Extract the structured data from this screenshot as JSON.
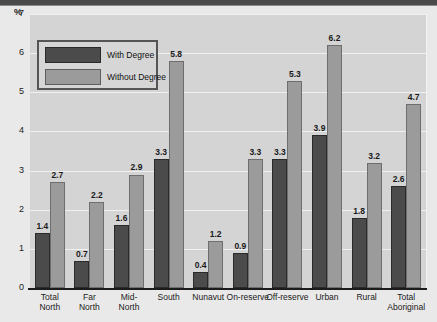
{
  "chart_data": {
    "type": "bar",
    "title": "",
    "subtitle": "",
    "xlabel": "",
    "ylabel": "%",
    "ylim": [
      0,
      7
    ],
    "ytick_labels": [
      "0",
      "1",
      "2",
      "3",
      "4",
      "5",
      "6",
      "7"
    ],
    "yticks": [
      0,
      1,
      2,
      3,
      4,
      5,
      6,
      7
    ],
    "grid": true,
    "legend_position": "top-left",
    "categories": [
      "Total North",
      "Far North",
      "Mid-North",
      "South",
      "Nunavut",
      "On-reserve",
      "Off-reserve",
      "Urban",
      "Rural",
      "Total Aboriginal"
    ],
    "category_lines": [
      [
        "Total",
        "North"
      ],
      [
        "Far",
        "North"
      ],
      [
        "Mid-",
        "North"
      ],
      [
        "South"
      ],
      [
        "Nunavut"
      ],
      [
        "On-reserve"
      ],
      [
        "Off-reserve"
      ],
      [
        "Urban"
      ],
      [
        "Rural"
      ],
      [
        "Total",
        "Aboriginal"
      ]
    ],
    "series": [
      {
        "name": "With Degree",
        "color": "#4b4b4b",
        "values": [
          1.4,
          0.7,
          1.6,
          3.3,
          0.4,
          0.9,
          3.3,
          3.9,
          1.8,
          2.6
        ],
        "labels": [
          "1.4",
          "0.7",
          "1.6",
          "3.3",
          "0.4",
          "0.9",
          "3.3",
          "3.9",
          "1.8",
          "2.6"
        ]
      },
      {
        "name": "Without Degree",
        "color": "#9b9b9b",
        "values": [
          2.7,
          2.2,
          2.9,
          5.8,
          1.2,
          3.3,
          5.3,
          6.2,
          3.2,
          4.7
        ],
        "labels": [
          "2.7",
          "2.2",
          "2.9",
          "5.8",
          "1.2",
          "3.3",
          "5.3",
          "6.2",
          "3.2",
          "4.7"
        ]
      }
    ]
  },
  "legend": {
    "items": [
      {
        "label": "With Degree",
        "swatch": "with"
      },
      {
        "label": "Without Degree",
        "swatch": "without"
      }
    ]
  },
  "axis": {
    "unit_label": "%"
  },
  "colors": {
    "with_degree": "#4b4b4b",
    "without_degree": "#9b9b9b",
    "plot_background": "#d4d4d4",
    "page_background": "#e9e9e9",
    "gridline": "#f0f0f0",
    "axis": "#1c1c1c"
  }
}
